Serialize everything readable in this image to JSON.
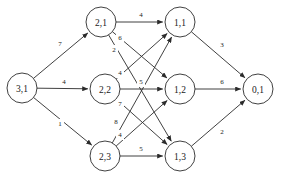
{
  "diagram": {
    "type": "directed-network-graph",
    "title": "",
    "background_color": "#ffffff",
    "line_color": "#2b2b2b",
    "text_color": "#1a1a1a",
    "node_radius": 15,
    "canvas": {
      "width": 282,
      "height": 181
    }
  },
  "nodes": [
    {
      "id": "n31",
      "label": "3,1",
      "x": 22,
      "y": 88,
      "layer": 0
    },
    {
      "id": "n21",
      "label": "2,1",
      "x": 101,
      "y": 22,
      "layer": 1
    },
    {
      "id": "n22",
      "label": "2,2",
      "x": 105,
      "y": 89,
      "layer": 1
    },
    {
      "id": "n23",
      "label": "2,3",
      "x": 105,
      "y": 156,
      "layer": 1
    },
    {
      "id": "n11",
      "label": "1,1",
      "x": 180,
      "y": 22,
      "layer": 2
    },
    {
      "id": "n12",
      "label": "1,2",
      "x": 180,
      "y": 89,
      "layer": 2
    },
    {
      "id": "n13",
      "label": "1,3",
      "x": 180,
      "y": 156,
      "layer": 2
    },
    {
      "id": "n01",
      "label": "0,1",
      "x": 258,
      "y": 89,
      "layer": 3
    }
  ],
  "edges": [
    {
      "id": "e31_21",
      "from": "n31",
      "to": "n21",
      "weight": "7",
      "lx": 60,
      "ly": 44
    },
    {
      "id": "e31_22",
      "from": "n31",
      "to": "n22",
      "weight": "4",
      "lx": 64,
      "ly": 82
    },
    {
      "id": "e31_23",
      "from": "n31",
      "to": "n23",
      "weight": "1",
      "lx": 60,
      "ly": 124
    },
    {
      "id": "e21_11",
      "from": "n21",
      "to": "n11",
      "weight": "4",
      "lx": 141,
      "ly": 15
    },
    {
      "id": "e21_12",
      "from": "n21",
      "to": "n12",
      "weight": "6",
      "lx": 120,
      "ly": 38
    },
    {
      "id": "e21_13",
      "from": "n21",
      "to": "n13",
      "weight": "2",
      "lx": 114,
      "ly": 50
    },
    {
      "id": "e22_11",
      "from": "n22",
      "to": "n11",
      "weight": "4",
      "lx": 120,
      "ly": 73
    },
    {
      "id": "e22_12",
      "from": "n22",
      "to": "n12",
      "weight": "5",
      "lx": 141,
      "ly": 82
    },
    {
      "id": "e22_13",
      "from": "n22",
      "to": "n13",
      "weight": "7",
      "lx": 120,
      "ly": 104
    },
    {
      "id": "e23_11",
      "from": "n23",
      "to": "n11",
      "weight": "8",
      "lx": 116,
      "ly": 122
    },
    {
      "id": "e23_12",
      "from": "n23",
      "to": "n12",
      "weight": "4",
      "lx": 120,
      "ly": 135
    },
    {
      "id": "e23_13",
      "from": "n23",
      "to": "n13",
      "weight": "5",
      "lx": 141,
      "ly": 149
    },
    {
      "id": "e11_01",
      "from": "n11",
      "to": "n01",
      "weight": "3",
      "lx": 222,
      "ly": 45
    },
    {
      "id": "e12_01",
      "from": "n12",
      "to": "n01",
      "weight": "6",
      "lx": 222,
      "ly": 82
    },
    {
      "id": "e13_01",
      "from": "n13",
      "to": "n01",
      "weight": "2",
      "lx": 222,
      "ly": 132
    }
  ]
}
